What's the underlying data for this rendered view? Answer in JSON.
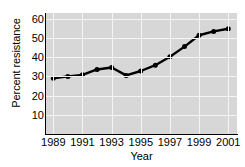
{
  "chart_data": {
    "type": "line",
    "title": "",
    "xlabel": "Year",
    "ylabel": "Percent resistance",
    "x": [
      1989,
      1990,
      1991,
      1992,
      1993,
      1994,
      1995,
      1996,
      1997,
      1998,
      1999,
      2000,
      2001
    ],
    "values": [
      29.0,
      30.0,
      30.8,
      33.6,
      34.6,
      30.5,
      32.8,
      35.8,
      40.2,
      45.5,
      51.4,
      53.4,
      54.8
    ],
    "series": [
      {
        "name": "Percent resistance",
        "values": [
          29.0,
          30.0,
          30.8,
          33.6,
          34.6,
          30.5,
          32.8,
          35.8,
          40.2,
          45.5,
          51.4,
          53.4,
          54.8
        ]
      }
    ],
    "xlim": [
      1988.5,
      2001.6
    ],
    "ylim": [
      0,
      63
    ],
    "ytick_labels": [
      "10",
      "20",
      "30",
      "40",
      "50",
      "60"
    ],
    "yticks": [
      10,
      20,
      30,
      40,
      50,
      60
    ],
    "xtick_labels": [
      "1989",
      "1991",
      "1993",
      "1995",
      "1997",
      "1999",
      "2001"
    ],
    "xticks": [
      1989,
      1991,
      1993,
      1995,
      1997,
      1999,
      2001
    ],
    "grid": true,
    "grid_color": "#f4f4f4",
    "panel_color": "#d7d7d7",
    "line_color": "#000000",
    "marker": "circle",
    "legend": "none"
  }
}
